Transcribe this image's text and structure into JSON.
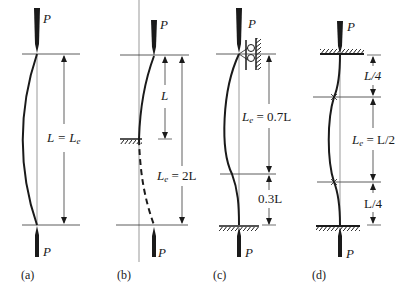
{
  "figure": {
    "load_label": "P",
    "panels": [
      {
        "id": "a",
        "caption": "(a)",
        "support": "pinned-pinned",
        "dimensions": [
          {
            "label_main": "L = L",
            "label_sub": "e"
          }
        ]
      },
      {
        "id": "b",
        "caption": "(b)",
        "support": "fixed-free",
        "dimensions": [
          {
            "label_main": "L",
            "label_sub": ""
          },
          {
            "label_main": "L",
            "label_sub": "e",
            "label_tail": " = 2L"
          }
        ]
      },
      {
        "id": "c",
        "caption": "(c)",
        "support": "fixed-pinned",
        "dimensions": [
          {
            "label_main": "L",
            "label_sub": "e",
            "label_tail": " = 0.7L"
          },
          {
            "label_main": "0.3L",
            "label_sub": ""
          }
        ]
      },
      {
        "id": "d",
        "caption": "(d)",
        "support": "fixed-fixed",
        "dimensions": [
          {
            "label_main": "L/4",
            "label_sub": ""
          },
          {
            "label_main": "L",
            "label_sub": "e",
            "label_tail": " = L/2"
          },
          {
            "label_main": "L/4",
            "label_sub": ""
          }
        ]
      }
    ]
  }
}
